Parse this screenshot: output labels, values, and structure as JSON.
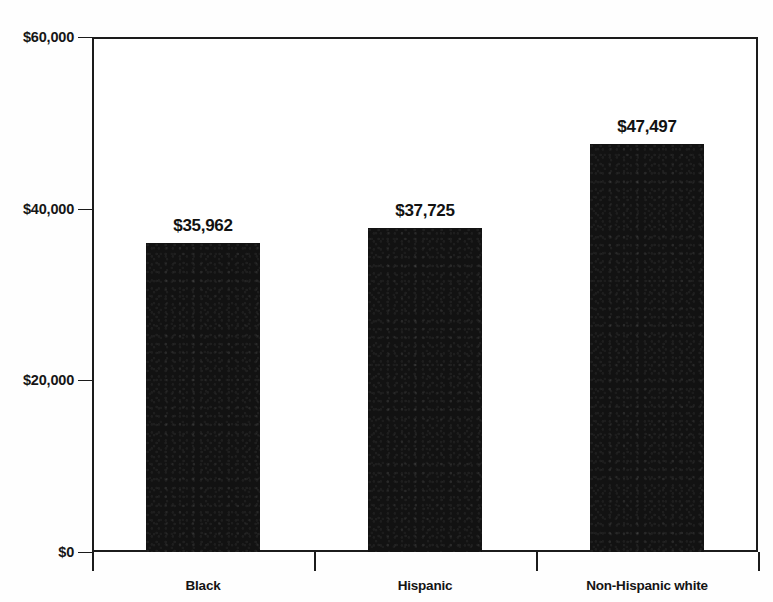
{
  "chart_data": {
    "type": "bar",
    "title": "",
    "subtitle": "",
    "xlabel": "",
    "ylabel": "",
    "categories": [
      "Black",
      "Hispanic",
      "Non-Hispanic white"
    ],
    "values": [
      35962,
      37725,
      47497
    ],
    "value_labels": [
      "$35,962",
      "$37,725",
      "$47,497"
    ],
    "ylim": [
      0,
      60000
    ],
    "yticks": [
      0,
      20000,
      40000,
      60000
    ],
    "ytick_labels": [
      "$0",
      "$20,000",
      "$40,000",
      "$60,000"
    ],
    "grid": "horizontal",
    "legend": "none",
    "series": [
      {
        "name": "Median income",
        "values": [
          35962,
          37725,
          47497
        ]
      }
    ],
    "bar_color": "#121212",
    "axis_color": "#1b1b1b",
    "background_color": "#ffffff"
  },
  "ghost": {
    "top_strip": ""
  }
}
